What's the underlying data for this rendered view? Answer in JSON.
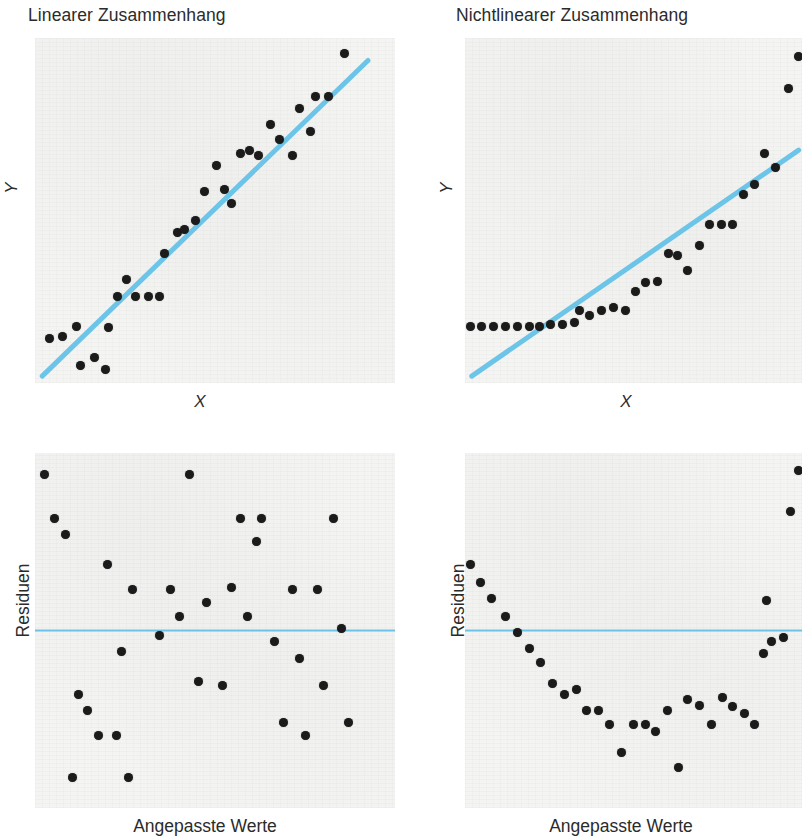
{
  "figure": {
    "background_color": "#ffffff",
    "plot_background_color": "#f4f4f3",
    "point_color": "#1b1b1b",
    "line_color": "#6cc5e8",
    "text_color": "#2b2b2b"
  },
  "panels": {
    "top_left": {
      "title": "Linearer Zusammenhang",
      "xlabel": "X",
      "ylabel": "Y"
    },
    "top_right": {
      "title": "Nichtlinearer Zusammenhang",
      "xlabel": "X",
      "ylabel": "Y"
    },
    "bottom_left": {
      "title": "",
      "xlabel": "Angepasste Werte",
      "ylabel": "Residuen"
    },
    "bottom_right": {
      "title": "",
      "xlabel": "Angepasste Werte",
      "ylabel": "Residuen"
    }
  },
  "chart_data": [
    {
      "id": "linear-scatter",
      "type": "scatter",
      "title": "Linearer Zusammenhang",
      "xlabel": "X",
      "ylabel": "Y",
      "xlim": [
        0,
        100
      ],
      "ylim": [
        0,
        100
      ],
      "grid": false,
      "legend": "none",
      "annotations": [
        "Regressionsgerade (hellblau)"
      ],
      "fit_line": {
        "x0": 2.0,
        "y0": 2.0,
        "x1": 92.5,
        "y1": 93.5,
        "color": "#6cc5e8"
      },
      "points": [
        {
          "x": 4.0,
          "y": 13.0
        },
        {
          "x": 7.5,
          "y": 13.5
        },
        {
          "x": 11.5,
          "y": 16.5
        },
        {
          "x": 12.5,
          "y": 5.0
        },
        {
          "x": 16.5,
          "y": 7.5
        },
        {
          "x": 19.5,
          "y": 4.0
        },
        {
          "x": 20.5,
          "y": 16.0
        },
        {
          "x": 23.0,
          "y": 25.0
        },
        {
          "x": 25.5,
          "y": 30.0
        },
        {
          "x": 28.0,
          "y": 25.0
        },
        {
          "x": 31.5,
          "y": 25.0
        },
        {
          "x": 34.5,
          "y": 25.0
        },
        {
          "x": 36.0,
          "y": 37.5
        },
        {
          "x": 39.5,
          "y": 43.5
        },
        {
          "x": 41.5,
          "y": 44.5
        },
        {
          "x": 44.5,
          "y": 47.0
        },
        {
          "x": 47.0,
          "y": 55.5
        },
        {
          "x": 50.5,
          "y": 63.0
        },
        {
          "x": 52.5,
          "y": 56.0
        },
        {
          "x": 54.5,
          "y": 52.0
        },
        {
          "x": 57.0,
          "y": 66.5
        },
        {
          "x": 59.5,
          "y": 67.5
        },
        {
          "x": 62.0,
          "y": 66.0
        },
        {
          "x": 65.5,
          "y": 75.0
        },
        {
          "x": 68.0,
          "y": 70.5
        },
        {
          "x": 71.5,
          "y": 66.0
        },
        {
          "x": 73.5,
          "y": 79.5
        },
        {
          "x": 76.5,
          "y": 73.0
        },
        {
          "x": 78.0,
          "y": 83.0
        },
        {
          "x": 81.5,
          "y": 83.0
        },
        {
          "x": 86.0,
          "y": 95.5
        }
      ]
    },
    {
      "id": "nonlinear-scatter",
      "type": "scatter",
      "title": "Nichtlinearer Zusammenhang",
      "xlabel": "X",
      "ylabel": "Y",
      "xlim": [
        0,
        100
      ],
      "ylim": [
        0,
        100
      ],
      "grid": false,
      "legend": "none",
      "annotations": [
        "Regressionsgerade (hellblau)",
        "Punkte folgen einer gekruemmten Kurve"
      ],
      "fit_line": {
        "x0": 2.0,
        "y0": 2.0,
        "x1": 99.0,
        "y1": 67.5,
        "color": "#6cc5e8"
      },
      "points": [
        {
          "x": 1.5,
          "y": 16.5
        },
        {
          "x": 5.0,
          "y": 16.5
        },
        {
          "x": 8.5,
          "y": 16.5
        },
        {
          "x": 12.0,
          "y": 16.5
        },
        {
          "x": 15.5,
          "y": 16.5
        },
        {
          "x": 19.0,
          "y": 16.5
        },
        {
          "x": 22.0,
          "y": 16.5
        },
        {
          "x": 25.5,
          "y": 17.0
        },
        {
          "x": 29.0,
          "y": 17.0
        },
        {
          "x": 32.5,
          "y": 17.5
        },
        {
          "x": 34.0,
          "y": 21.0
        },
        {
          "x": 37.0,
          "y": 19.5
        },
        {
          "x": 40.5,
          "y": 21.0
        },
        {
          "x": 44.0,
          "y": 22.0
        },
        {
          "x": 47.5,
          "y": 21.0
        },
        {
          "x": 50.5,
          "y": 26.5
        },
        {
          "x": 53.5,
          "y": 29.0
        },
        {
          "x": 57.0,
          "y": 29.5
        },
        {
          "x": 60.5,
          "y": 37.5
        },
        {
          "x": 63.0,
          "y": 37.0
        },
        {
          "x": 66.0,
          "y": 32.5
        },
        {
          "x": 69.5,
          "y": 40.0
        },
        {
          "x": 72.5,
          "y": 46.0
        },
        {
          "x": 76.0,
          "y": 46.0
        },
        {
          "x": 79.5,
          "y": 46.0
        },
        {
          "x": 82.5,
          "y": 54.5
        },
        {
          "x": 86.0,
          "y": 57.5
        },
        {
          "x": 89.0,
          "y": 66.5
        },
        {
          "x": 92.0,
          "y": 62.5
        },
        {
          "x": 96.0,
          "y": 85.5
        },
        {
          "x": 99.0,
          "y": 94.5
        }
      ]
    },
    {
      "id": "linear-residuals",
      "type": "scatter",
      "title": "",
      "xlabel": "Angepasste Werte",
      "ylabel": "Residuen",
      "xlim": [
        0,
        100
      ],
      "ylim": [
        -50,
        50
      ],
      "grid": false,
      "legend": "none",
      "annotations": [
        "Nulllinie (hellblau) — Residuen zufaellig gestreut"
      ],
      "zero_line": {
        "y": 0,
        "color": "#6cc5e8"
      },
      "points": [
        {
          "x": 2.5,
          "y": 44.0
        },
        {
          "x": 5.5,
          "y": 31.5
        },
        {
          "x": 8.5,
          "y": 27.0
        },
        {
          "x": 20.0,
          "y": 18.5
        },
        {
          "x": 27.0,
          "y": 11.5
        },
        {
          "x": 24.0,
          "y": -6.0
        },
        {
          "x": 37.5,
          "y": 11.5
        },
        {
          "x": 40.0,
          "y": 4.0
        },
        {
          "x": 34.5,
          "y": -1.5
        },
        {
          "x": 43.0,
          "y": 44.0
        },
        {
          "x": 47.5,
          "y": 8.0
        },
        {
          "x": 45.5,
          "y": -14.5
        },
        {
          "x": 52.0,
          "y": -15.5
        },
        {
          "x": 54.5,
          "y": 12.0
        },
        {
          "x": 57.0,
          "y": 31.5
        },
        {
          "x": 63.0,
          "y": 31.5
        },
        {
          "x": 61.5,
          "y": 25.0
        },
        {
          "x": 59.0,
          "y": 4.0
        },
        {
          "x": 66.5,
          "y": -3.0
        },
        {
          "x": 71.5,
          "y": 11.5
        },
        {
          "x": 73.5,
          "y": -8.0
        },
        {
          "x": 78.5,
          "y": 11.5
        },
        {
          "x": 83.0,
          "y": 31.5
        },
        {
          "x": 85.0,
          "y": 0.5
        },
        {
          "x": 80.0,
          "y": -15.5
        },
        {
          "x": 87.0,
          "y": -26.0
        },
        {
          "x": 69.0,
          "y": -26.0
        },
        {
          "x": 75.0,
          "y": -29.5
        },
        {
          "x": 12.0,
          "y": -18.0
        },
        {
          "x": 14.5,
          "y": -22.5
        },
        {
          "x": 17.5,
          "y": -29.5
        },
        {
          "x": 22.5,
          "y": -29.5
        },
        {
          "x": 10.5,
          "y": -41.5
        },
        {
          "x": 26.0,
          "y": -41.5
        }
      ]
    },
    {
      "id": "nonlinear-residuals",
      "type": "scatter",
      "title": "",
      "xlabel": "Angepasste Werte",
      "ylabel": "Residuen",
      "xlim": [
        0,
        100
      ],
      "ylim": [
        -50,
        50
      ],
      "grid": false,
      "legend": "none",
      "annotations": [
        "Nulllinie (hellblau) — U-foermiges Muster zeigt Nichtlinearitaet"
      ],
      "zero_line": {
        "y": 0,
        "color": "#6cc5e8"
      },
      "points": [
        {
          "x": 1.5,
          "y": 18.5
        },
        {
          "x": 4.5,
          "y": 13.5
        },
        {
          "x": 8.0,
          "y": 9.0
        },
        {
          "x": 12.0,
          "y": 4.0
        },
        {
          "x": 15.5,
          "y": -0.5
        },
        {
          "x": 19.0,
          "y": -5.0
        },
        {
          "x": 22.5,
          "y": -9.0
        },
        {
          "x": 26.0,
          "y": -15.0
        },
        {
          "x": 29.5,
          "y": -18.0
        },
        {
          "x": 33.0,
          "y": -16.5
        },
        {
          "x": 36.0,
          "y": -22.5
        },
        {
          "x": 39.5,
          "y": -22.5
        },
        {
          "x": 43.0,
          "y": -26.5
        },
        {
          "x": 46.5,
          "y": -34.5
        },
        {
          "x": 50.0,
          "y": -26.5
        },
        {
          "x": 53.5,
          "y": -26.5
        },
        {
          "x": 56.5,
          "y": -28.5
        },
        {
          "x": 60.0,
          "y": -22.5
        },
        {
          "x": 63.5,
          "y": -38.5
        },
        {
          "x": 66.0,
          "y": -19.5
        },
        {
          "x": 69.5,
          "y": -21.0
        },
        {
          "x": 73.0,
          "y": -26.5
        },
        {
          "x": 76.5,
          "y": -19.0
        },
        {
          "x": 79.5,
          "y": -21.5
        },
        {
          "x": 83.0,
          "y": -23.5
        },
        {
          "x": 86.0,
          "y": -26.5
        },
        {
          "x": 88.5,
          "y": -6.5
        },
        {
          "x": 91.0,
          "y": -3.0
        },
        {
          "x": 89.5,
          "y": 8.5
        },
        {
          "x": 94.5,
          "y": -2.0
        },
        {
          "x": 96.5,
          "y": 33.5
        },
        {
          "x": 99.0,
          "y": 45.0
        }
      ]
    }
  ]
}
